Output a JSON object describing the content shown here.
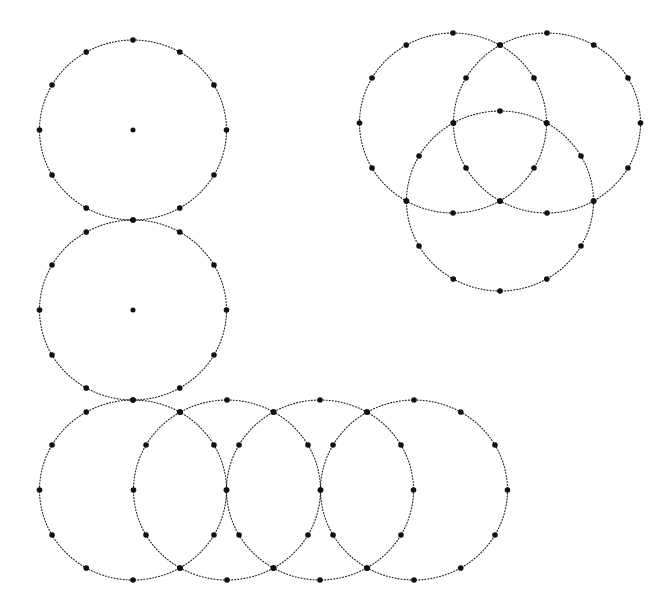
{
  "diagram": {
    "type": "dotted-circle-constructions",
    "background": "#ffffff",
    "stroke_color": "#1a1a1a",
    "marker_color": "#111111",
    "radius_x": 93.5,
    "radius_y": 90,
    "marker_radius": 2.8,
    "markers_per_circle": 12,
    "groups": [
      {
        "name": "single-circle-top-left",
        "circles": [
          {
            "cx": 133,
            "cy": 130,
            "show_center": true
          }
        ]
      },
      {
        "name": "single-circle-middle-left",
        "circles": [
          {
            "cx": 133,
            "cy": 310,
            "show_center": true
          }
        ]
      },
      {
        "name": "four-circle-chain-bottom",
        "circles": [
          {
            "cx": 133,
            "cy": 490,
            "show_center": false
          },
          {
            "cx": 227,
            "cy": 490,
            "show_center": false
          },
          {
            "cx": 320,
            "cy": 490,
            "show_center": false
          },
          {
            "cx": 414,
            "cy": 490,
            "show_center": false
          }
        ]
      },
      {
        "name": "three-circle-cluster-top-right",
        "circles": [
          {
            "cx": 453,
            "cy": 123,
            "show_center": false
          },
          {
            "cx": 547,
            "cy": 123,
            "show_center": false
          },
          {
            "cx": 500,
            "cy": 201,
            "show_center": false
          }
        ]
      }
    ]
  }
}
